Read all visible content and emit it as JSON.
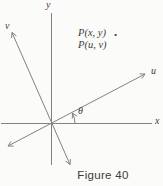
{
  "figure": {
    "axis_labels": {
      "y": "y",
      "v": "v",
      "u": "u",
      "x": "x"
    },
    "angle_label": "θ",
    "point_labels": {
      "line1": "P(x, y)",
      "marker": "•",
      "line2": "P(u, v)"
    },
    "caption": "Figure 40",
    "colors": {
      "line": "#828282",
      "text": "#3c3c3c",
      "background": "#fbfbf9"
    }
  }
}
